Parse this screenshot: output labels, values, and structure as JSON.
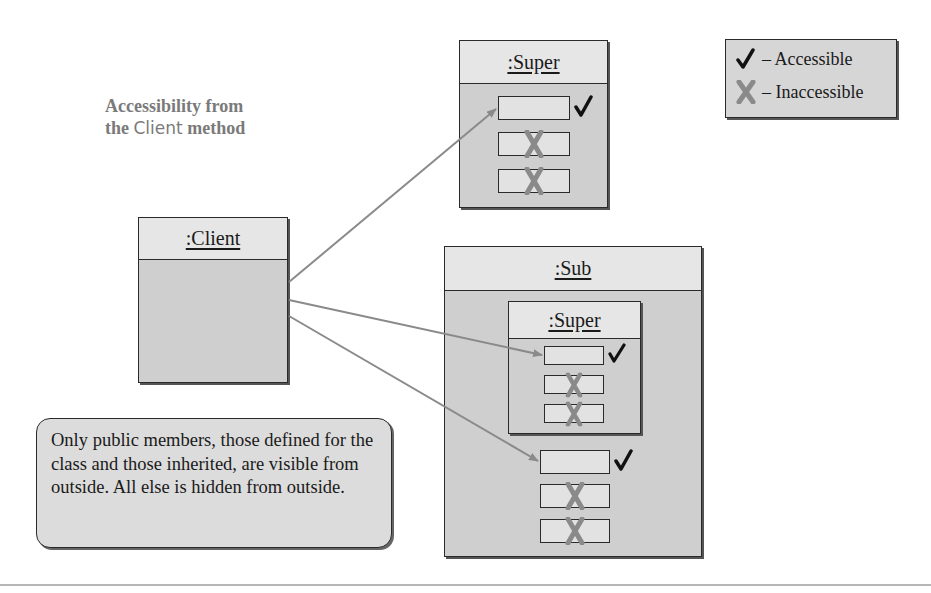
{
  "title": {
    "line1": "Accessibility from",
    "line2_prefix": "the ",
    "line2_code": "Client",
    "line2_suffix": " method"
  },
  "legend": {
    "accessible_icon": "check-icon",
    "accessible_label": "– Accessible",
    "inaccessible_icon": "x-icon",
    "inaccessible_label": "– Inaccessible"
  },
  "objects": {
    "client": {
      "label": ":Client"
    },
    "super": {
      "label": ":Super",
      "members": [
        {
          "access": "accessible"
        },
        {
          "access": "inaccessible"
        },
        {
          "access": "inaccessible"
        }
      ]
    },
    "sub": {
      "label": ":Sub",
      "inner_super": {
        "label": ":Super",
        "members": [
          {
            "access": "accessible"
          },
          {
            "access": "inaccessible"
          },
          {
            "access": "inaccessible"
          }
        ]
      },
      "members": [
        {
          "access": "accessible"
        },
        {
          "access": "inaccessible"
        },
        {
          "access": "inaccessible"
        }
      ]
    }
  },
  "arrows": [
    {
      "from": ":Client",
      "to": ":Super public member"
    },
    {
      "from": ":Client",
      "to": ":Sub > :Super public member"
    },
    {
      "from": ":Client",
      "to": ":Sub public member"
    }
  ],
  "callout": {
    "text": "Only public members, those defined for the class and those inherited, are visible from outside. All else is hidden from outside."
  },
  "colors": {
    "check": "#111111",
    "x": "#8a8a8a",
    "arrow": "#8a8a8a",
    "object_body": "#cfcfcf",
    "object_header": "#e6e6e6"
  }
}
